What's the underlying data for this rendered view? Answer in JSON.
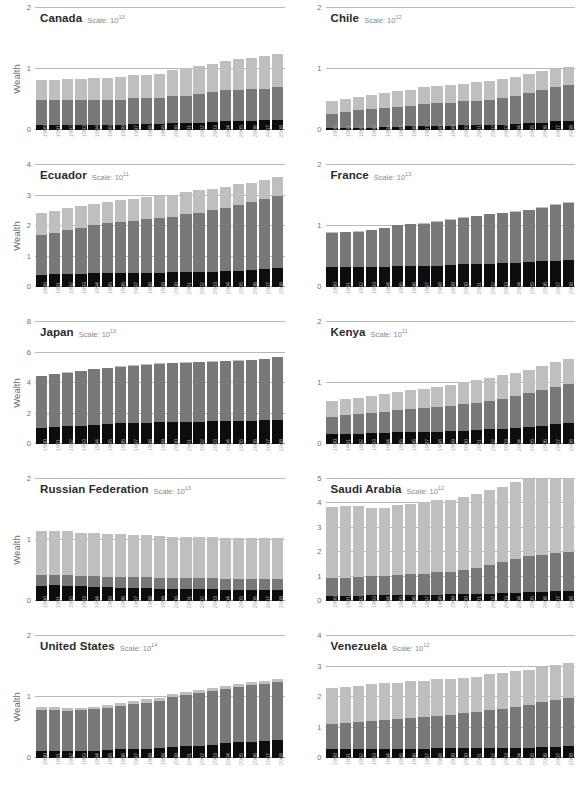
{
  "figure": {
    "y_axis_label": "Wealth",
    "scale_prefix": "Scale:",
    "scale_base": "10",
    "years": [
      "1990",
      "1991",
      "1992",
      "1993",
      "1994",
      "1995",
      "1996",
      "1997",
      "1998",
      "1999",
      "2000",
      "2001",
      "2002",
      "2003",
      "2004",
      "2005",
      "2006",
      "2007",
      "2008"
    ],
    "colors": {
      "dark": "#0d0d0d",
      "mid": "#787878",
      "light": "#bfbfbf",
      "gridline": "#b9b9b9",
      "tick_text": "#6f6f6f",
      "xtick_text": "#a8a8a8",
      "title_text": "#2b2b2b",
      "scale_text": "#8a8a8a"
    }
  },
  "chart_data": {
    "type": "bar",
    "title": "",
    "subtitle": "",
    "xlabel": "",
    "ylabel": "Wealth",
    "grid": true,
    "legend_position": "none",
    "stacked": true,
    "categories": [
      "1990",
      "1991",
      "1992",
      "1993",
      "1994",
      "1995",
      "1996",
      "1997",
      "1998",
      "1999",
      "2000",
      "2001",
      "2002",
      "2003",
      "2004",
      "2005",
      "2006",
      "2007",
      "2008"
    ],
    "series_names": [
      "Natural Capital",
      "Produced Capital",
      "Intangible Capital"
    ],
    "panels": [
      {
        "name": "Canada",
        "scale_exponent": "13",
        "ylim": [
          0,
          2
        ],
        "yticks": [
          0,
          1,
          2
        ],
        "series": [
          {
            "name": "Natural Capital",
            "color": "#0d0d0d",
            "values": [
              0.09,
              0.09,
              0.09,
              0.09,
              0.09,
              0.09,
              0.09,
              0.1,
              0.1,
              0.1,
              0.11,
              0.11,
              0.12,
              0.13,
              0.14,
              0.15,
              0.15,
              0.16,
              0.17
            ]
          },
          {
            "name": "Produced Capital",
            "color": "#787878",
            "values": [
              0.4,
              0.4,
              0.41,
              0.41,
              0.41,
              0.41,
              0.41,
              0.42,
              0.43,
              0.43,
              0.44,
              0.45,
              0.47,
              0.49,
              0.51,
              0.51,
              0.52,
              0.52,
              0.54
            ]
          },
          {
            "name": "Intangible Capital",
            "color": "#bfbfbf",
            "values": [
              0.33,
              0.33,
              0.33,
              0.34,
              0.35,
              0.36,
              0.37,
              0.38,
              0.38,
              0.39,
              0.43,
              0.46,
              0.46,
              0.47,
              0.48,
              0.5,
              0.51,
              0.53,
              0.54
            ]
          }
        ]
      },
      {
        "name": "Chile",
        "scale_exponent": "12",
        "ylim": [
          0,
          2
        ],
        "yticks": [
          0,
          1,
          2
        ],
        "series": [
          {
            "name": "Natural Capital",
            "color": "#0d0d0d",
            "values": [
              0.03,
              0.04,
              0.04,
              0.04,
              0.05,
              0.05,
              0.06,
              0.07,
              0.07,
              0.07,
              0.08,
              0.08,
              0.09,
              0.09,
              0.1,
              0.11,
              0.12,
              0.14,
              0.15
            ]
          },
          {
            "name": "Produced Capital",
            "color": "#787878",
            "values": [
              0.23,
              0.26,
              0.28,
              0.3,
              0.31,
              0.33,
              0.34,
              0.36,
              0.37,
              0.38,
              0.39,
              0.4,
              0.41,
              0.43,
              0.45,
              0.49,
              0.53,
              0.56,
              0.59
            ]
          },
          {
            "name": "Intangible Capital",
            "color": "#bfbfbf",
            "values": [
              0.21,
              0.21,
              0.22,
              0.24,
              0.24,
              0.26,
              0.26,
              0.28,
              0.28,
              0.29,
              0.29,
              0.3,
              0.31,
              0.31,
              0.32,
              0.32,
              0.31,
              0.3,
              0.3
            ]
          }
        ]
      },
      {
        "name": "Ecuador",
        "scale_exponent": "11",
        "ylim": [
          0,
          4
        ],
        "yticks": [
          0,
          1,
          2,
          3,
          4
        ],
        "series": [
          {
            "name": "Natural Capital",
            "color": "#0d0d0d",
            "values": [
              0.41,
              0.42,
              0.43,
              0.44,
              0.45,
              0.45,
              0.46,
              0.47,
              0.47,
              0.47,
              0.48,
              0.49,
              0.49,
              0.5,
              0.52,
              0.54,
              0.56,
              0.59,
              0.62
            ]
          },
          {
            "name": "Produced Capital",
            "color": "#787878",
            "values": [
              1.28,
              1.36,
              1.45,
              1.48,
              1.58,
              1.65,
              1.67,
              1.68,
              1.75,
              1.79,
              1.83,
              1.9,
              1.94,
              2.02,
              2.07,
              2.16,
              2.23,
              2.28,
              2.35
            ]
          },
          {
            "name": "Intangible Capital",
            "color": "#bfbfbf",
            "values": [
              0.75,
              0.72,
              0.7,
              0.73,
              0.7,
              0.7,
              0.71,
              0.73,
              0.73,
              0.74,
              0.72,
              0.71,
              0.76,
              0.69,
              0.69,
              0.69,
              0.62,
              0.65,
              0.64
            ]
          }
        ]
      },
      {
        "name": "France",
        "scale_exponent": "13",
        "ylim": [
          0,
          2
        ],
        "yticks": [
          0,
          1,
          2
        ],
        "series": [
          {
            "name": "Natural Capital",
            "color": "#0d0d0d",
            "values": [
              0.33,
              0.33,
              0.33,
              0.33,
              0.33,
              0.34,
              0.34,
              0.34,
              0.35,
              0.36,
              0.37,
              0.38,
              0.38,
              0.39,
              0.4,
              0.41,
              0.42,
              0.43,
              0.44
            ]
          },
          {
            "name": "Produced Capital",
            "color": "#787878",
            "values": [
              0.56,
              0.57,
              0.58,
              0.6,
              0.63,
              0.67,
              0.69,
              0.7,
              0.72,
              0.74,
              0.76,
              0.78,
              0.81,
              0.82,
              0.83,
              0.85,
              0.88,
              0.92,
              0.94
            ]
          },
          {
            "name": "Intangible Capital",
            "color": "#bfbfbf",
            "values": [
              0.01,
              0.01,
              0.01,
              0.01,
              0.01,
              0.01,
              0.01,
              0.01,
              0.01,
              0.01,
              0.01,
              0.01,
              0.01,
              0.01,
              0.01,
              0.01,
              0.01,
              0.01,
              0.01
            ]
          }
        ]
      },
      {
        "name": "Japan",
        "scale_exponent": "13",
        "ylim": [
          0,
          8
        ],
        "yticks": [
          0,
          2,
          4,
          6,
          8
        ],
        "series": [
          {
            "name": "Natural Capital",
            "color": "#0d0d0d",
            "values": [
              1.07,
              1.12,
              1.16,
              1.21,
              1.25,
              1.3,
              1.35,
              1.39,
              1.41,
              1.43,
              1.45,
              1.46,
              1.47,
              1.48,
              1.5,
              1.52,
              1.54,
              1.56,
              1.58
            ]
          },
          {
            "name": "Produced Capital",
            "color": "#787878",
            "values": [
              3.38,
              3.46,
              3.52,
              3.57,
              3.65,
              3.69,
              3.72,
              3.75,
              3.8,
              3.84,
              3.86,
              3.88,
              3.89,
              3.92,
              3.94,
              3.95,
              3.98,
              4.01,
              4.1
            ]
          },
          {
            "name": "Intangible Capital",
            "color": "#bfbfbf",
            "values": [
              0.02,
              0.02,
              0.02,
              0.02,
              0.02,
              0.02,
              0.02,
              0.02,
              0.02,
              0.02,
              0.02,
              0.02,
              0.02,
              0.02,
              0.02,
              0.02,
              0.02,
              0.02,
              0.02
            ]
          }
        ]
      },
      {
        "name": "Kenya",
        "scale_exponent": "11",
        "ylim": [
          0,
          2
        ],
        "yticks": [
          0,
          1,
          2
        ],
        "series": [
          {
            "name": "Natural Capital",
            "color": "#0d0d0d",
            "values": [
              0.17,
              0.17,
              0.17,
              0.18,
              0.18,
              0.19,
              0.19,
              0.2,
              0.2,
              0.21,
              0.22,
              0.23,
              0.24,
              0.25,
              0.26,
              0.28,
              0.3,
              0.32,
              0.34
            ]
          },
          {
            "name": "Produced Capital",
            "color": "#787878",
            "values": [
              0.27,
              0.3,
              0.32,
              0.33,
              0.35,
              0.36,
              0.38,
              0.39,
              0.4,
              0.41,
              0.43,
              0.45,
              0.47,
              0.49,
              0.52,
              0.55,
              0.58,
              0.61,
              0.64
            ]
          },
          {
            "name": "Intangible Capital",
            "color": "#bfbfbf",
            "values": [
              0.26,
              0.26,
              0.26,
              0.27,
              0.29,
              0.3,
              0.31,
              0.32,
              0.33,
              0.34,
              0.36,
              0.37,
              0.38,
              0.39,
              0.39,
              0.39,
              0.4,
              0.41,
              0.42
            ]
          }
        ]
      },
      {
        "name": "Russian Federation",
        "scale_exponent": "13",
        "ylim": [
          0,
          2
        ],
        "yticks": [
          0,
          1,
          2
        ],
        "series": [
          {
            "name": "Natural Capital",
            "color": "#0d0d0d",
            "values": [
              0.25,
              0.26,
              0.25,
              0.24,
              0.23,
              0.23,
              0.22,
              0.22,
              0.21,
              0.2,
              0.19,
              0.19,
              0.19,
              0.19,
              0.18,
              0.18,
              0.18,
              0.18,
              0.18
            ]
          },
          {
            "name": "Produced Capital",
            "color": "#787878",
            "values": [
              0.17,
              0.16,
              0.17,
              0.17,
              0.18,
              0.17,
              0.18,
              0.18,
              0.18,
              0.18,
              0.18,
              0.18,
              0.18,
              0.18,
              0.18,
              0.18,
              0.18,
              0.18,
              0.18
            ]
          },
          {
            "name": "Intangible Capital",
            "color": "#bfbfbf",
            "values": [
              0.73,
              0.72,
              0.72,
              0.71,
              0.7,
              0.7,
              0.7,
              0.69,
              0.69,
              0.69,
              0.68,
              0.68,
              0.68,
              0.68,
              0.68,
              0.68,
              0.68,
              0.68,
              0.68
            ]
          }
        ]
      },
      {
        "name": "Saudi Arabia",
        "scale_exponent": "12",
        "ylim": [
          0,
          5
        ],
        "yticks": [
          0,
          1,
          2,
          3,
          4,
          5
        ],
        "series": [
          {
            "name": "Natural Capital",
            "color": "#0d0d0d",
            "values": [
              0.21,
              0.22,
              0.22,
              0.23,
              0.23,
              0.24,
              0.25,
              0.26,
              0.26,
              0.27,
              0.28,
              0.29,
              0.3,
              0.31,
              0.33,
              0.36,
              0.4,
              0.44,
              0.49
            ]
          },
          {
            "name": "Produced Capital",
            "color": "#787878",
            "values": [
              0.73,
              0.74,
              0.76,
              0.79,
              0.81,
              0.82,
              0.84,
              0.86,
              0.93,
              0.91,
              1.0,
              1.08,
              1.17,
              1.27,
              1.39,
              1.52,
              1.62,
              1.73,
              1.78
            ]
          },
          {
            "name": "Intangible Capital",
            "color": "#bfbfbf",
            "values": [
              2.91,
              2.92,
              2.92,
              2.8,
              2.79,
              2.87,
              2.89,
              2.92,
              2.93,
              2.98,
              2.99,
              3.01,
              3.06,
              3.11,
              3.17,
              3.24,
              3.29,
              3.35,
              3.43
            ]
          }
        ]
      },
      {
        "name": "United States",
        "scale_exponent": "14",
        "ylim": [
          0,
          2
        ],
        "yticks": [
          0,
          1,
          2
        ],
        "series": [
          {
            "name": "Natural Capital",
            "color": "#0d0d0d",
            "values": [
              0.11,
              0.11,
              0.11,
              0.12,
              0.12,
              0.13,
              0.14,
              0.15,
              0.15,
              0.16,
              0.18,
              0.19,
              0.2,
              0.22,
              0.24,
              0.26,
              0.27,
              0.28,
              0.29
            ]
          },
          {
            "name": "Produced Capital",
            "color": "#787878",
            "values": [
              0.67,
              0.68,
              0.66,
              0.66,
              0.68,
              0.69,
              0.72,
              0.74,
              0.76,
              0.77,
              0.82,
              0.85,
              0.87,
              0.88,
              0.89,
              0.9,
              0.92,
              0.94,
              0.95
            ]
          },
          {
            "name": "Intangible Capital",
            "color": "#bfbfbf",
            "values": [
              0.05,
              0.05,
              0.05,
              0.04,
              0.04,
              0.05,
              0.05,
              0.05,
              0.05,
              0.06,
              0.05,
              0.05,
              0.05,
              0.05,
              0.05,
              0.05,
              0.05,
              0.05,
              0.05
            ]
          }
        ]
      },
      {
        "name": "Venezuela",
        "scale_exponent": "12",
        "ylim": [
          0,
          4
        ],
        "yticks": [
          0,
          1,
          2,
          3,
          4
        ],
        "series": [
          {
            "name": "Natural Capital",
            "color": "#0d0d0d",
            "values": [
              0.29,
              0.3,
              0.3,
              0.31,
              0.31,
              0.31,
              0.31,
              0.31,
              0.32,
              0.32,
              0.32,
              0.32,
              0.32,
              0.32,
              0.33,
              0.34,
              0.35,
              0.37,
              0.39
            ]
          },
          {
            "name": "Produced Capital",
            "color": "#787878",
            "values": [
              0.81,
              0.84,
              0.88,
              0.91,
              0.94,
              0.98,
              1.0,
              1.05,
              1.06,
              1.1,
              1.16,
              1.19,
              1.25,
              1.29,
              1.35,
              1.4,
              1.48,
              1.54,
              1.59
            ]
          },
          {
            "name": "Intangible Capital",
            "color": "#bfbfbf",
            "values": [
              1.18,
              1.18,
              1.19,
              1.2,
              1.2,
              1.18,
              1.2,
              1.17,
              1.2,
              1.17,
              1.14,
              1.16,
              1.17,
              1.17,
              1.16,
              1.16,
              1.14,
              1.15,
              1.14
            ]
          }
        ]
      }
    ]
  }
}
